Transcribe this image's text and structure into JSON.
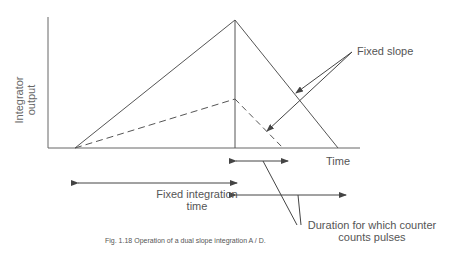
{
  "figure": {
    "caption": "Fig. 1.18  Operation of a dual slope integration  A / D.",
    "y_axis_label_line1": "Integrator",
    "y_axis_label_line2": "output",
    "x_axis_label": "Time",
    "annotations": {
      "fixed_slope": "Fixed slope",
      "fixed_integration_line1": "Fixed integration",
      "fixed_integration_line2": "time",
      "duration_line1": "Duration for which counter",
      "duration_line2": "counts pulses"
    },
    "colors": {
      "line": "#555555",
      "text": "#555555"
    }
  }
}
